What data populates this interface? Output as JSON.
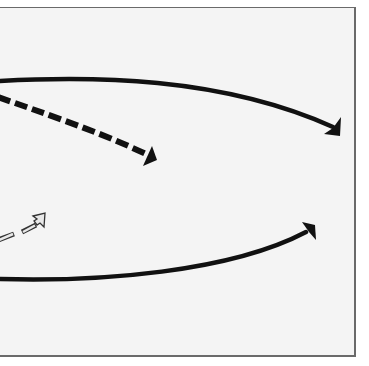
{
  "diagram": {
    "type": "arrow-diagram",
    "frame": {
      "border_color": "#6a6a6a",
      "background": "#f4f4f4"
    },
    "arrows": [
      {
        "id": "top-solid-arc",
        "style": "solid",
        "color": "#111111",
        "direction": "left-to-right, curving down",
        "start": [
          0,
          81
        ],
        "end": [
          340,
          135
        ]
      },
      {
        "id": "dashed-arrow",
        "style": "dashed",
        "color": "#111111",
        "direction": "left-to-right, descending",
        "start": [
          0,
          97
        ],
        "end": [
          156,
          160
        ]
      },
      {
        "id": "hollow-dashed-arrow",
        "style": "hollow-outline-dashed",
        "color": "#333333",
        "direction": "left-to-right, ascending",
        "start": [
          0,
          243
        ],
        "end": [
          45,
          215
        ]
      },
      {
        "id": "bottom-solid-arc",
        "style": "solid",
        "color": "#111111",
        "direction": "left-to-right, curving up",
        "start": [
          0,
          279
        ],
        "end": [
          315,
          224
        ]
      }
    ]
  }
}
